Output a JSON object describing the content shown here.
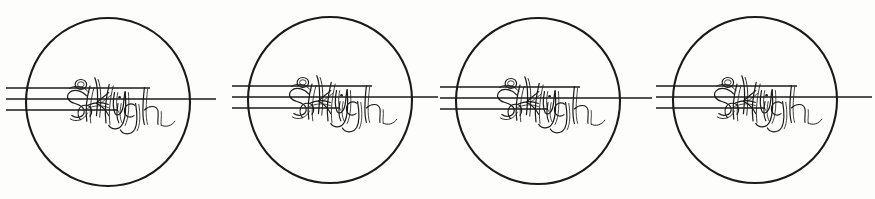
{
  "document": {
    "kind": "trademark-specimen-drawing",
    "medium": "black-ink-line-drawing-on-white",
    "background_color": "#fdfdfc",
    "ink_color": "#1a1a1a",
    "canvas": {
      "width": 875,
      "height": 199
    },
    "repeat_count": 4,
    "description": "Four identical circular logo marks in a horizontal row, each containing the words 'Sky High' in outline script with three horizontal rule lines passing through."
  },
  "logo": {
    "wordmark_line_1": "Sky",
    "wordmark_line_2": "High",
    "wordmark_full": "Sky High",
    "lettering_style": "outline-script-cursive",
    "enclosure_shape": "circle",
    "stroke_color": "#1a1a1a",
    "fill_color": "#ffffff"
  },
  "rules": {
    "count": 3,
    "labels": [
      "upper-rule",
      "middle-rule",
      "lower-rule"
    ],
    "middle_rule_extends_right": true,
    "y_offsets": [
      -14,
      -3,
      8
    ]
  },
  "marks": [
    {
      "index": 1,
      "cx": 108,
      "cy": 102,
      "rx": 82,
      "ry": 84,
      "left_lead_in_x": 6,
      "right_lead_out_x": 216
    },
    {
      "index": 2,
      "cx": 330,
      "cy": 100,
      "rx": 82,
      "ry": 83,
      "left_lead_in_x": 232,
      "right_lead_out_x": 438
    },
    {
      "index": 3,
      "cx": 538,
      "cy": 101,
      "rx": 82,
      "ry": 83,
      "left_lead_in_x": 440,
      "right_lead_out_x": 652
    },
    {
      "index": 4,
      "cx": 755,
      "cy": 100,
      "rx": 82,
      "ry": 83,
      "left_lead_in_x": 656,
      "right_lead_out_x": 872
    }
  ]
}
